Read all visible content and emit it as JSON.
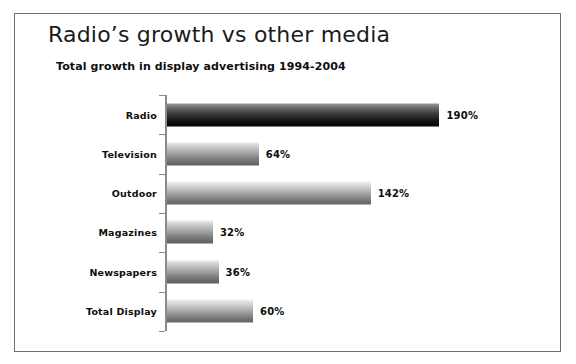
{
  "frame": {
    "border_color": "#6f6f6f",
    "background": "#ffffff"
  },
  "header": {
    "title": "Radio’s growth vs other media",
    "subtitle": "Total growth in display advertising 1994-2004"
  },
  "axis": {
    "line_color": "#8a8a8a"
  },
  "chart_data": {
    "type": "bar",
    "orientation": "horizontal",
    "title": "Radio’s growth vs other media",
    "subtitle": "Total growth in display advertising 1994-2004",
    "xlabel": "",
    "ylabel": "",
    "xlim": [
      0,
      200
    ],
    "grid": false,
    "legend": false,
    "value_suffix": "%",
    "categories": [
      "Radio",
      "Television",
      "Outdoor",
      "Magazines",
      "Newspapers",
      "Total Display"
    ],
    "values": [
      190,
      64,
      142,
      32,
      36,
      60
    ],
    "labels": [
      "190%",
      "64%",
      "142%",
      "32%",
      "36%",
      "60%"
    ],
    "bar_styles": [
      "dark",
      "mid",
      "light",
      "mid",
      "mid",
      "light"
    ],
    "bars": [
      {
        "category": "Radio",
        "value": 190,
        "label": "190%",
        "style": "dark"
      },
      {
        "category": "Television",
        "value": 64,
        "label": "64%",
        "style": "mid"
      },
      {
        "category": "Outdoor",
        "value": 142,
        "label": "142%",
        "style": "light"
      },
      {
        "category": "Magazines",
        "value": 32,
        "label": "32%",
        "style": "mid"
      },
      {
        "category": "Newspapers",
        "value": 36,
        "label": "36%",
        "style": "mid"
      },
      {
        "category": "Total Display",
        "value": 60,
        "label": "60%",
        "style": "light"
      }
    ]
  }
}
